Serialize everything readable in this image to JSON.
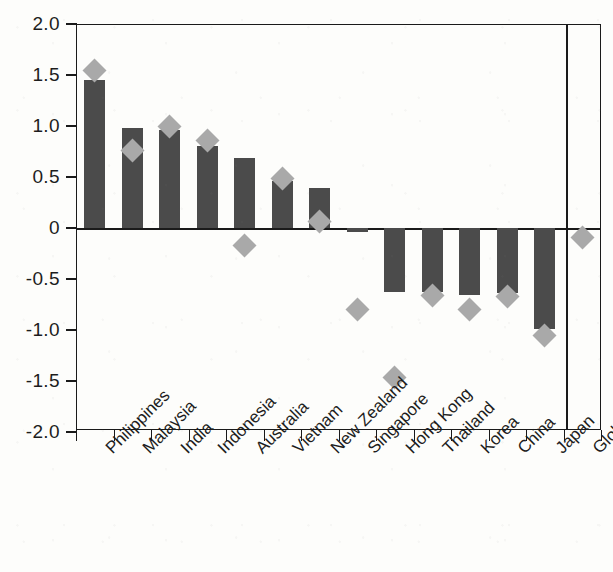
{
  "chart_data": {
    "type": "bar",
    "title": "",
    "subtitle": "",
    "xlabel": "",
    "ylabel": "",
    "ylim": [
      -2.0,
      2.0
    ],
    "grid": false,
    "legend_position": "none",
    "y_ticks": [
      "2.0",
      "1.5",
      "1.0",
      "0.5",
      "0",
      "-0.5",
      "-1.0",
      "-1.5",
      "-2.0"
    ],
    "y_tick_values": [
      2.0,
      1.5,
      1.0,
      0.5,
      0,
      -0.5,
      -1.0,
      -1.5,
      -2.0
    ],
    "categories": [
      "Philippines",
      "Malaysia",
      "India",
      "Indonesia",
      "Australia",
      "Vietnam",
      "New Zealand",
      "Singapore",
      "Hong Kong",
      "Thailand",
      "Korea",
      "China",
      "Japan",
      "Global impact"
    ],
    "series": [
      {
        "name": "bar-series",
        "marker": "bar",
        "color": "#4b4b4b",
        "values": [
          1.45,
          0.98,
          0.96,
          0.8,
          0.69,
          0.46,
          0.39,
          -0.04,
          -0.63,
          -0.63,
          -0.66,
          -0.64,
          -0.99,
          null
        ]
      },
      {
        "name": "diamond-series",
        "marker": "diamond",
        "color": "#a9a9a9",
        "values": [
          1.54,
          0.76,
          1.0,
          0.86,
          -0.17,
          0.49,
          0.06,
          -0.8,
          -1.47,
          -0.66,
          -0.8,
          -0.67,
          -1.05,
          -0.09
        ]
      }
    ],
    "separator_after_category": "Japan",
    "axis_color": "#1a1a1a",
    "background_color": "#fdfdfb"
  }
}
